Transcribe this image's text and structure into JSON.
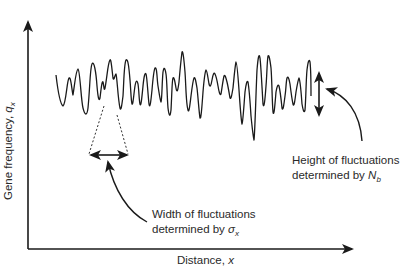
{
  "figure": {
    "type": "schematic diagram",
    "y_axis": {
      "label": "Gene frequency, ",
      "symbol": "q",
      "subscript": "x"
    },
    "x_axis": {
      "label": "Distance, ",
      "symbol": "x"
    },
    "annotations": {
      "width": {
        "line1": "Width of fluctuations",
        "line2": "determined by ",
        "symbol": "σ",
        "subscript": "x"
      },
      "height": {
        "line1": "Height of fluctuations",
        "line2": "determined by ",
        "symbol": "N",
        "subscript": "b"
      }
    },
    "colors": {
      "line": "#1a1a1a",
      "background": "#ffffff"
    }
  }
}
